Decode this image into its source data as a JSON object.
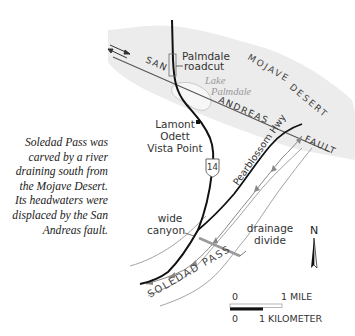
{
  "caption": {
    "lines": [
      "Soledad Pass was",
      "carved by a river",
      "draining south from",
      "the Mojave Desert.",
      "Its headwaters were",
      "displaced by the San",
      "Andreas fault."
    ]
  },
  "labels": {
    "palmdale_roadcut_1": "Palmdale",
    "palmdale_roadcut_2": "roadcut",
    "lake_1": "Lake",
    "lake_2": "Palmdale",
    "mojave": "MOJAVE",
    "desert": "DESERT",
    "san": "SAN",
    "andreas": "ANDREAS",
    "fault": "FAULT",
    "lamont_1": "Lamont",
    "lamont_2": "Odett",
    "lamont_3": "Vista Point",
    "route": "14",
    "highway": "Pearblossom Hwy",
    "wide_1": "wide",
    "wide_2": "canyon",
    "drainage_1": "drainage",
    "drainage_2": "divide",
    "pass": "SOLEDAD PASS",
    "north": "N"
  },
  "scale": {
    "mile_zero": "0",
    "mile_label": "1 MILE",
    "km_zero": "0",
    "km_label": "1 KILOMETER"
  },
  "colors": {
    "desert_shade": "#ececec",
    "fault": "#555555",
    "road": "#111111",
    "river": "#888888",
    "divide": "#9a9a9a",
    "text": "#333333"
  }
}
